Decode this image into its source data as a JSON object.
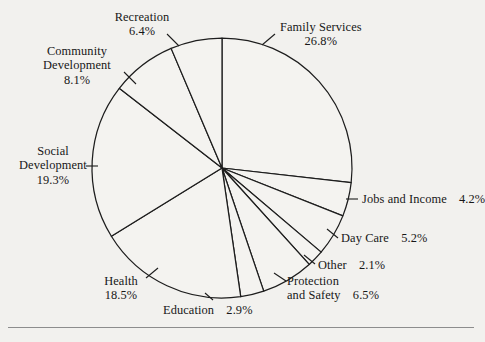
{
  "figure": {
    "background_color": "#f2f1ee",
    "ink_color": "#1d1d1d"
  },
  "chart_data": {
    "type": "pie",
    "title": "",
    "subtitle": "",
    "xlabel": "",
    "ylabel": "",
    "legend_position": "none",
    "grid": false,
    "units": "percent",
    "total": 100.0,
    "start_angle_deg": 0,
    "direction": "clockwise",
    "center": {
      "x": 222,
      "y": 168
    },
    "radius": 130,
    "categories": [
      "Family Services",
      "Jobs and Income",
      "Day Care",
      "Other",
      "Protection and Safety",
      "Education",
      "Health",
      "Social Development",
      "Community Development",
      "Recreation"
    ],
    "values": [
      26.8,
      4.2,
      5.2,
      2.1,
      6.5,
      2.9,
      18.5,
      19.3,
      8.1,
      6.4
    ],
    "slices": [
      {
        "name": "Family Services",
        "value": 26.8,
        "label": "Family Services",
        "percent_text": "26.8%",
        "label_layout": "stacked",
        "label_align": "left",
        "label_x": 280,
        "label_y": 20,
        "leader": {
          "x1": 275,
          "y1": 34,
          "x2": 262,
          "y2": 45
        }
      },
      {
        "name": "Jobs and Income",
        "value": 4.2,
        "label": "Jobs and Income",
        "percent_text": "4.2%",
        "label_layout": "inline",
        "label_align": "left",
        "label_x": 362,
        "label_y": 192,
        "leader": {
          "x1": 358,
          "y1": 199,
          "x2": 346,
          "y2": 199
        }
      },
      {
        "name": "Day Care",
        "value": 5.2,
        "label": "Day Care",
        "percent_text": "5.2%",
        "label_layout": "inline",
        "label_align": "left",
        "label_x": 341,
        "label_y": 231,
        "leader": {
          "x1": 338,
          "y1": 238,
          "x2": 327,
          "y2": 229
        }
      },
      {
        "name": "Other",
        "value": 2.1,
        "label": "Other",
        "percent_text": "2.1%",
        "label_layout": "inline",
        "label_align": "left",
        "label_x": 318,
        "label_y": 258,
        "leader": {
          "x1": 315,
          "y1": 264,
          "x2": 304,
          "y2": 255
        }
      },
      {
        "name": "Protection and Safety",
        "value": 6.5,
        "label_line1": "Protection",
        "label_line2": "and Safety",
        "percent_text": "6.5%",
        "label_layout": "two-line-inline",
        "label_align": "left",
        "label_x": 287,
        "label_y": 274,
        "leader": {
          "x1": 286,
          "y1": 281,
          "x2": 274,
          "y2": 273
        }
      },
      {
        "name": "Education",
        "value": 2.9,
        "label": "Education",
        "percent_text": "2.9%",
        "label_layout": "inline",
        "label_align": "left",
        "label_x": 163,
        "label_y": 303,
        "leader": {
          "x1": 213,
          "y1": 300,
          "x2": 205,
          "y2": 293
        }
      },
      {
        "name": "Health",
        "value": 18.5,
        "label": "Health",
        "percent_text": "18.5%",
        "label_layout": "stacked",
        "label_align": "center",
        "label_x": 92,
        "label_y": 274,
        "leader": {
          "x1": 146,
          "y1": 278,
          "x2": 158,
          "y2": 268
        }
      },
      {
        "name": "Social Development",
        "value": 19.3,
        "label_line1": "Social",
        "label_line2": "Development",
        "percent_text": "19.3%",
        "label_layout": "stacked-two-line",
        "label_align": "center",
        "label_x": 24,
        "label_y": 144,
        "leader": {
          "x1": 98,
          "y1": 166,
          "x2": 86,
          "y2": 166
        }
      },
      {
        "name": "Community Development",
        "value": 8.1,
        "label_line1": "Community",
        "label_line2": "Development",
        "percent_text": "8.1%",
        "label_layout": "stacked-two-line",
        "label_align": "center",
        "label_x": 36,
        "label_y": 44,
        "leader": {
          "x1": 124,
          "y1": 72,
          "x2": 136,
          "y2": 84
        }
      },
      {
        "name": "Recreation",
        "value": 6.4,
        "label": "Recreation",
        "percent_text": "6.4%",
        "label_layout": "stacked",
        "label_align": "center",
        "label_x": 122,
        "label_y": 10,
        "leader": {
          "x1": 167,
          "y1": 34,
          "x2": 179,
          "y2": 46
        }
      }
    ]
  }
}
